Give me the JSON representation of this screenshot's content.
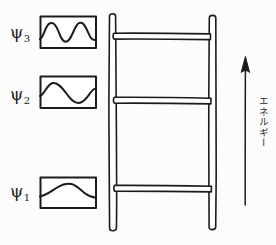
{
  "figure": {
    "title": "",
    "background_color": "#fcfcfc",
    "ink_color": "#1b1b1b",
    "width": 276,
    "height": 245
  },
  "wavefunctions": [
    {
      "label": "ψ",
      "subscript": "3",
      "name": "psi-3",
      "quantum_number": 3,
      "half_waves": 3,
      "description": "three half-wavelengths: crest, trough, crest",
      "box": {
        "x": 40,
        "y": 16,
        "width": 56,
        "height": 32
      },
      "label_pos": {
        "x": 10,
        "y": 24
      }
    },
    {
      "label": "ψ",
      "subscript": "2",
      "name": "psi-2",
      "quantum_number": 2,
      "half_waves": 2,
      "description": "two half-wavelengths: crest then trough",
      "box": {
        "x": 40,
        "y": 76,
        "width": 56,
        "height": 32
      },
      "label_pos": {
        "x": 10,
        "y": 86
      }
    },
    {
      "label": "ψ",
      "subscript": "1",
      "name": "psi-1",
      "quantum_number": 1,
      "half_waves": 1,
      "description": "single half-wavelength: one broad crest",
      "box": {
        "x": 40,
        "y": 177,
        "width": 56,
        "height": 31
      },
      "label_pos": {
        "x": 10,
        "y": 183
      }
    }
  ],
  "ladder": {
    "name": "energy-level-ladder",
    "rail_left": {
      "x": 112,
      "top": 12,
      "bottom": 232
    },
    "rail_right": {
      "x": 212,
      "top": 14,
      "bottom": 230
    },
    "rungs": [
      {
        "y": 36,
        "name": "ladder-rung-top"
      },
      {
        "y": 100,
        "name": "ladder-rung-middle"
      },
      {
        "y": 188,
        "name": "ladder-rung-bottom"
      }
    ]
  },
  "energy_axis": {
    "name": "energy-arrow",
    "text": "エネルギー",
    "text_romaji_meaning": "energy",
    "direction": "up",
    "arrow": {
      "x": 245,
      "tip_y": 57,
      "tail_y": 205
    }
  }
}
